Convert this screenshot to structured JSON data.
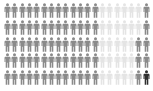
{
  "chart_data": {
    "type": "pictogram",
    "title": "",
    "rows": 5,
    "columns": 20,
    "icon": "person-icon",
    "legend": [],
    "categories": [
      "light",
      "gray",
      "dark"
    ],
    "colors": {
      "light": "#e4e4e4",
      "gray": "#8a8a8a",
      "dark": "#2e2e2e"
    },
    "counts": {
      "light": 27,
      "gray": 72,
      "dark": 1
    },
    "grid": [
      [
        "gray",
        "gray",
        "gray",
        "gray",
        "gray",
        "gray",
        "gray",
        "gray",
        "gray",
        "gray",
        "gray",
        "gray",
        "gray",
        "light",
        "light",
        "light",
        "light",
        "light",
        "light",
        "gray"
      ],
      [
        "gray",
        "gray",
        "gray",
        "gray",
        "gray",
        "gray",
        "gray",
        "gray",
        "gray",
        "gray",
        "gray",
        "gray",
        "gray",
        "light",
        "light",
        "light",
        "light",
        "light",
        "light",
        "gray"
      ],
      [
        "gray",
        "gray",
        "gray",
        "gray",
        "gray",
        "gray",
        "gray",
        "gray",
        "gray",
        "gray",
        "gray",
        "gray",
        "gray",
        "light",
        "light",
        "light",
        "light",
        "light",
        "gray",
        "gray"
      ],
      [
        "gray",
        "gray",
        "gray",
        "gray",
        "gray",
        "gray",
        "gray",
        "gray",
        "gray",
        "gray",
        "gray",
        "gray",
        "gray",
        "light",
        "light",
        "light",
        "light",
        "light",
        "gray",
        "gray"
      ],
      [
        "gray",
        "gray",
        "gray",
        "gray",
        "gray",
        "gray",
        "gray",
        "gray",
        "gray",
        "gray",
        "gray",
        "gray",
        "gray",
        "light",
        "light",
        "light",
        "light",
        "light",
        "gray",
        "dark"
      ]
    ]
  }
}
